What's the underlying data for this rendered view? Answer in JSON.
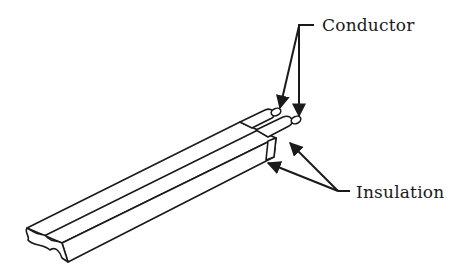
{
  "diagram": {
    "type": "labeled-illustration",
    "labels": {
      "conductor": "Conductor",
      "insulation": "Insulation"
    },
    "colors": {
      "line": "#1a1a1a",
      "background": "#ffffff"
    }
  }
}
